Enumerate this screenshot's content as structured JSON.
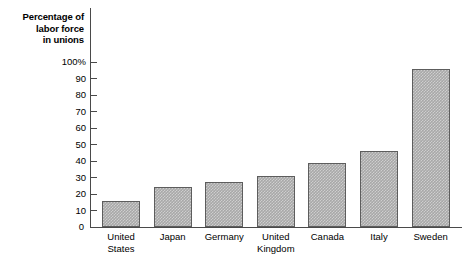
{
  "chart_data": {
    "type": "bar",
    "title": "",
    "ylabel": "Percentage of labor force in unions",
    "ylabel_lines": [
      "Percentage of",
      "labor force",
      "in unions"
    ],
    "xlabel": "",
    "categories": [
      "United States",
      "Japan",
      "Germany",
      "United Kingdom",
      "Canada",
      "Italy",
      "Sweden"
    ],
    "category_lines": [
      [
        "United",
        "States"
      ],
      [
        "Japan"
      ],
      [
        "Germany"
      ],
      [
        "United",
        "Kingdom"
      ],
      [
        "Canada"
      ],
      [
        "Italy"
      ],
      [
        "Sweden"
      ]
    ],
    "values": [
      16,
      24,
      27,
      31,
      39,
      46,
      96
    ],
    "ylim": [
      0,
      100
    ],
    "ytick_values": [
      0,
      10,
      20,
      30,
      40,
      50,
      60,
      70,
      80,
      90,
      100
    ],
    "ytick_labels": [
      "0",
      "10",
      "20",
      "30",
      "40",
      "50",
      "60",
      "70",
      "80",
      "90",
      "100%"
    ],
    "grid": false,
    "legend": null,
    "colors": {
      "bar_fill": "#a8a8a8",
      "bar_border": "#5d5d5d",
      "axis": "#4a4a4a",
      "text": "#000000",
      "background": "#ffffff"
    }
  }
}
